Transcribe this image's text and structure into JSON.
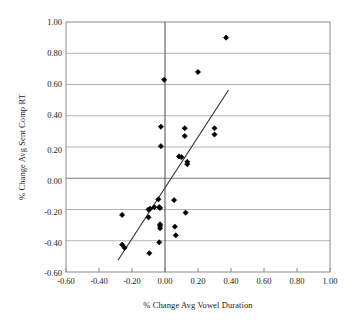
{
  "chart_data": {
    "type": "scatter",
    "title": "",
    "xlabel": "% Change Avg Vowel Duration",
    "ylabel": "% Change Avg Sent Comp RT",
    "xlim": [
      -0.6,
      1.0
    ],
    "ylim": [
      -0.6,
      1.0
    ],
    "xticks": [
      "-0.60",
      "-0.40",
      "-0.20",
      "0.00",
      "0.20",
      "0.40",
      "0.60",
      "0.80",
      "1.00"
    ],
    "xtick_values": [
      -0.6,
      -0.4,
      -0.2,
      0.0,
      0.2,
      0.4,
      0.6,
      0.8,
      1.0
    ],
    "yticks": [
      "1.00",
      "0.80",
      "0.60",
      "0.40",
      "0.20",
      "0.00",
      "-0.20",
      "-0.40",
      "-0.60"
    ],
    "ytick_values": [
      1.0,
      0.8,
      0.6,
      0.4,
      0.2,
      0.0,
      -0.2,
      -0.4,
      -0.6
    ],
    "grid": "horizontal",
    "legend": "none",
    "marker": "filled-diamond",
    "marker_color": "#000000",
    "points": [
      {
        "x": 0.37,
        "y": 0.9
      },
      {
        "x": 0.2,
        "y": 0.68
      },
      {
        "x": -0.005,
        "y": 0.63
      },
      {
        "x": 0.3,
        "y": 0.32
      },
      {
        "x": 0.3,
        "y": 0.28
      },
      {
        "x": 0.12,
        "y": 0.32
      },
      {
        "x": 0.12,
        "y": 0.27
      },
      {
        "x": -0.025,
        "y": 0.33
      },
      {
        "x": -0.025,
        "y": 0.205
      },
      {
        "x": 0.085,
        "y": 0.14
      },
      {
        "x": 0.1,
        "y": 0.135
      },
      {
        "x": 0.135,
        "y": 0.105
      },
      {
        "x": 0.135,
        "y": 0.09
      },
      {
        "x": -0.04,
        "y": -0.135
      },
      {
        "x": 0.055,
        "y": -0.14
      },
      {
        "x": -0.1,
        "y": -0.2
      },
      {
        "x": -0.09,
        "y": -0.195
      },
      {
        "x": -0.065,
        "y": -0.185
      },
      {
        "x": -0.035,
        "y": -0.185
      },
      {
        "x": -0.03,
        "y": -0.19
      },
      {
        "x": -0.26,
        "y": -0.235
      },
      {
        "x": 0.125,
        "y": -0.22
      },
      {
        "x": -0.1,
        "y": -0.25
      },
      {
        "x": -0.03,
        "y": -0.295
      },
      {
        "x": -0.03,
        "y": -0.305
      },
      {
        "x": -0.03,
        "y": -0.32
      },
      {
        "x": 0.06,
        "y": -0.31
      },
      {
        "x": 0.065,
        "y": -0.365
      },
      {
        "x": -0.035,
        "y": -0.41
      },
      {
        "x": -0.26,
        "y": -0.425
      },
      {
        "x": -0.245,
        "y": -0.445
      },
      {
        "x": -0.095,
        "y": -0.48
      }
    ],
    "trend_line": {
      "x_start": -0.285,
      "y_start": -0.525,
      "x_end": 0.385,
      "y_end": 0.565,
      "color": "#333333"
    }
  }
}
